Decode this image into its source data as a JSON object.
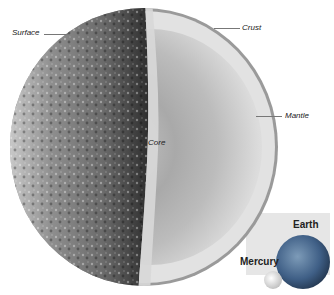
{
  "diagram": {
    "labels": {
      "surface": "Surface",
      "crust": "Crust",
      "mantle": "Mantle",
      "core": "Core"
    },
    "comparison": {
      "earth": "Earth",
      "mercury": "Mercury"
    },
    "colors": {
      "surface_dark": "#3a3a3a",
      "surface_light": "#bdbdbd",
      "crust": "#9a9a9a",
      "mantle": "#e2e2e2",
      "core": "#b9b9b9",
      "inset_bg": "#e6e6e6",
      "earth_blue": "#3f5f86"
    }
  }
}
